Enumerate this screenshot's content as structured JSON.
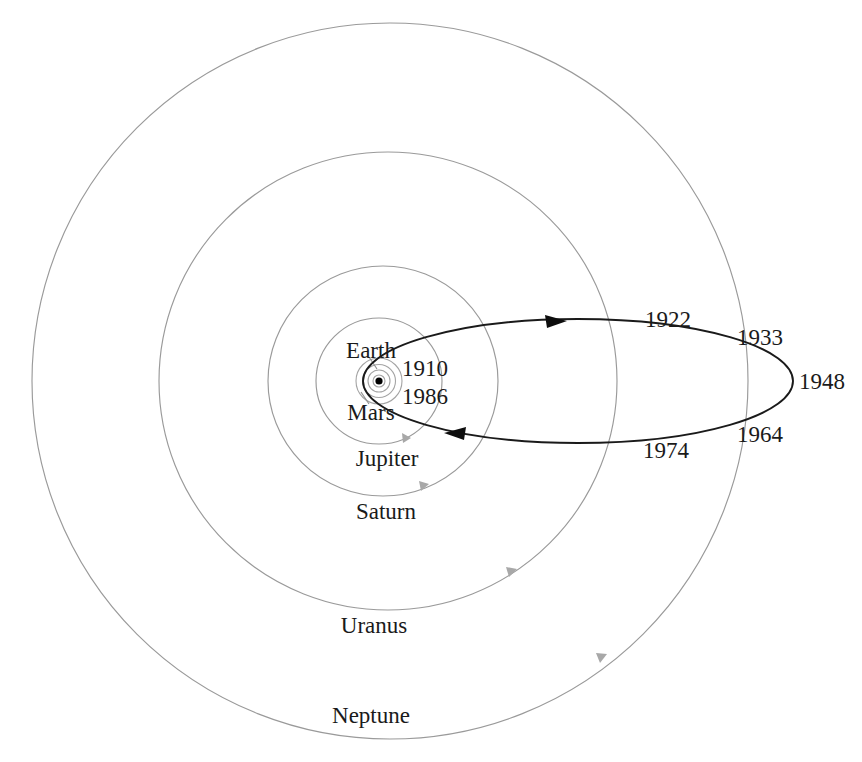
{
  "figure": {
    "kind": "orbital-diagram",
    "background_color": "#ffffff",
    "orbit_color": "#9a9a9a",
    "comet_orbit_color": "#1a1a1a",
    "text_color": "#1a1a1a",
    "sun_marker_color": "#000000"
  },
  "sun": {
    "name": "Sun",
    "x": 379,
    "y": 381,
    "dot_radius": 3.5
  },
  "inner_orbits": [
    {
      "name": "Mercury",
      "radius": 6
    },
    {
      "name": "Venus",
      "radius": 11
    },
    {
      "name": "Earth",
      "radius": 16.5
    },
    {
      "name": "Mars",
      "radius": 23
    }
  ],
  "outer_orbits": [
    {
      "name": "Jupiter",
      "radius": 63,
      "center_x": 379,
      "center_y": 381
    },
    {
      "name": "Saturn",
      "radius": 115,
      "center_x": 383,
      "center_y": 381
    },
    {
      "name": "Uranus",
      "radius": 229,
      "center_x": 388,
      "center_y": 381
    },
    {
      "name": "Neptune",
      "radius": 358,
      "center_x": 390,
      "center_y": 381
    }
  ],
  "planet_labels": [
    {
      "text": "Earth",
      "x": 371,
      "y": 350,
      "anchor": "middle"
    },
    {
      "text": "Mars",
      "x": 371,
      "y": 412,
      "anchor": "middle"
    },
    {
      "text": "Jupiter",
      "x": 387,
      "y": 458,
      "anchor": "middle"
    },
    {
      "text": "Saturn",
      "x": 386,
      "y": 511,
      "anchor": "middle"
    },
    {
      "text": "Uranus",
      "x": 374,
      "y": 625,
      "anchor": "middle"
    },
    {
      "text": "Neptune",
      "x": 371,
      "y": 715,
      "anchor": "middle"
    }
  ],
  "comet_orbit": {
    "label": "Comet orbit",
    "perihelion_x": 363,
    "perihelion_y": 381,
    "aphelion_x": 793,
    "aphelion_y": 381,
    "semi_minor": 62,
    "direction": "counterclockwise",
    "direction_arrows": [
      {
        "x": 556,
        "y": 322,
        "points": "right"
      },
      {
        "x": 455,
        "y": 432,
        "points": "left"
      }
    ]
  },
  "year_labels": [
    {
      "text": "1910",
      "x": 425,
      "y": 368
    },
    {
      "text": "1986",
      "x": 425,
      "y": 396
    },
    {
      "text": "1922",
      "x": 668,
      "y": 319
    },
    {
      "text": "1933",
      "x": 760,
      "y": 337
    },
    {
      "text": "1948",
      "x": 822,
      "y": 381
    },
    {
      "text": "1964",
      "x": 760,
      "y": 434
    },
    {
      "text": "1974",
      "x": 666,
      "y": 450
    }
  ],
  "planet_position_markers": [
    {
      "orbit": "Jupiter",
      "x": 411,
      "y": 438
    },
    {
      "orbit": "Saturn",
      "x": 429,
      "y": 484
    },
    {
      "orbit": "Uranus",
      "x": 516,
      "y": 569
    },
    {
      "orbit": "Neptune",
      "x": 606,
      "y": 654
    }
  ],
  "leader_lines": [
    {
      "from_label": "Earth",
      "x1": 369,
      "y1": 357,
      "x2": 377,
      "y2": 369
    },
    {
      "from_label": "Mars",
      "x1": 369,
      "y1": 404,
      "x2": 360,
      "y2": 392
    }
  ]
}
